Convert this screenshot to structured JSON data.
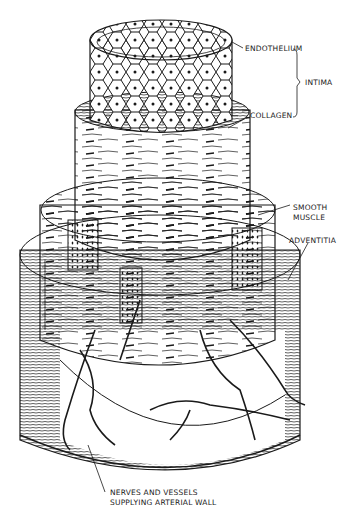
{
  "diagram": {
    "labels": {
      "endothelium": "ENDOTHELIUM",
      "intima": "INTIMA",
      "collagen": "COLLAGEN",
      "smooth_muscle_line1": "SMOOTH",
      "smooth_muscle_line2": "MUSCLE",
      "adventitia": "ADVENTITIA",
      "nerves_line1": "NERVES AND VESSELS",
      "nerves_line2": "SUPPLYING ARTERIAL WALL"
    },
    "layers": [
      {
        "name": "Endothelium",
        "group": "Intima",
        "depiction": "honeycomb cell pattern on top cylinder"
      },
      {
        "name": "Collagen",
        "group": "Intima",
        "depiction": "thin band below endothelium"
      },
      {
        "name": "Smooth Muscle",
        "depiction": "middle tier with spindle-shaped cells"
      },
      {
        "name": "Adventitia",
        "depiction": "outer base tier with fibrous texture"
      },
      {
        "name": "Nerves and Vessels",
        "depiction": "branching lines on outer wall"
      }
    ],
    "colors": {
      "ink": "#1a1a1a",
      "paper": "#ffffff"
    }
  }
}
